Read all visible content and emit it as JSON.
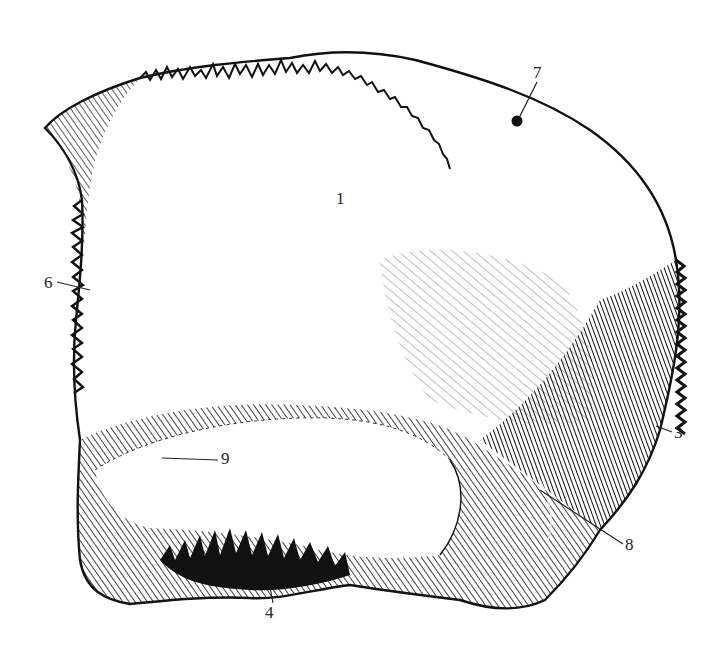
{
  "figure": {
    "background": "#ffffff",
    "ink": "#111111"
  },
  "labels": [
    {
      "id": "1",
      "text": "1",
      "x": 340,
      "y": 198
    },
    {
      "id": "7",
      "text": "7",
      "x": 537,
      "y": 70
    },
    {
      "id": "6",
      "text": "6",
      "x": 44,
      "y": 287
    },
    {
      "id": "3",
      "text": "3",
      "x": 674,
      "y": 428
    },
    {
      "id": "9",
      "text": "9",
      "x": 221,
      "y": 452
    },
    {
      "id": "8",
      "text": "8",
      "x": 625,
      "y": 540
    },
    {
      "id": "4",
      "text": "4",
      "x": 267,
      "y": 605
    }
  ]
}
